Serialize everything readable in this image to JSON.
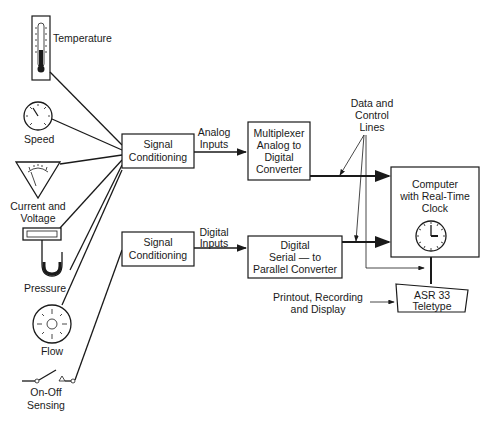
{
  "sensors": {
    "temperature": "Temperature",
    "speed": "Speed",
    "current_voltage_1": "Current and",
    "current_voltage_2": "Voltage",
    "pressure": "Pressure",
    "flow": "Flow",
    "onoff_1": "On-Off",
    "onoff_2": "Sensing"
  },
  "blocks": {
    "signal_cond_analog_1": "Signal",
    "signal_cond_analog_2": "Conditioning",
    "signal_cond_digital_1": "Signal",
    "signal_cond_digital_2": "Conditioning",
    "mux_1": "Multiplexer",
    "mux_2": "Analog to",
    "mux_3": "Digital",
    "mux_4": "Converter",
    "s2p_1": "Digital",
    "s2p_2": "Serial — to",
    "s2p_3": "Parallel Converter",
    "computer_1": "Computer",
    "computer_2": "with Real-Time",
    "computer_3": "Clock",
    "teletype_1": "ASR 33",
    "teletype_2": "Teletype"
  },
  "edge_labels": {
    "analog_1": "Analog",
    "analog_2": "Inputs",
    "digital_1": "Digital",
    "digital_2": "Inputs",
    "data_control_1": "Data and",
    "data_control_2": "Control",
    "data_control_3": "Lines",
    "printout_1": "Printout, Recording",
    "printout_2": "and Display"
  }
}
